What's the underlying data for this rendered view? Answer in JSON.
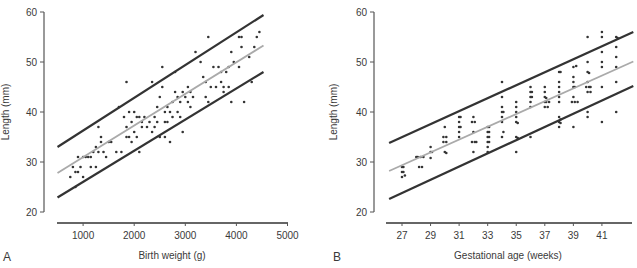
{
  "figure": {
    "panels": [
      "A",
      "B"
    ]
  },
  "chart_data": [
    {
      "panel_label": "A",
      "type": "scatter",
      "title": "",
      "xlabel": "Birth weight (g)",
      "ylabel": "Length (mm)",
      "xlim": [
        500,
        5000
      ],
      "ylim": [
        20,
        60
      ],
      "xticks": [
        1000,
        2000,
        3000,
        4000,
        5000
      ],
      "yticks": [
        20,
        30,
        40,
        50,
        60
      ],
      "grid": false,
      "legend": null,
      "lines": [
        {
          "name": "upper limit",
          "color": "#333333",
          "x": [
            500,
            4530
          ],
          "y": [
            33.0,
            59.4
          ]
        },
        {
          "name": "regression",
          "color": "#aaaaaa",
          "x": [
            500,
            4530
          ],
          "y": [
            27.8,
            53.3
          ]
        },
        {
          "name": "lower limit",
          "color": "#333333",
          "x": [
            500,
            4530
          ],
          "y": [
            22.9,
            48.0
          ]
        }
      ],
      "points": [
        [
          750,
          27
        ],
        [
          800,
          29
        ],
        [
          850,
          28
        ],
        [
          900,
          31
        ],
        [
          900,
          28
        ],
        [
          950,
          29
        ],
        [
          1000,
          31
        ],
        [
          1000,
          27
        ],
        [
          1050,
          31
        ],
        [
          1100,
          31
        ],
        [
          850,
          25
        ],
        [
          1150,
          29
        ],
        [
          1150,
          31
        ],
        [
          1200,
          32
        ],
        [
          1250,
          33
        ],
        [
          1250,
          29
        ],
        [
          1300,
          32
        ],
        [
          1300,
          37
        ],
        [
          1350,
          35
        ],
        [
          1350,
          34
        ],
        [
          1400,
          32
        ],
        [
          1450,
          31
        ],
        [
          1500,
          34
        ],
        [
          1550,
          34
        ],
        [
          1650,
          32
        ],
        [
          1700,
          41
        ],
        [
          1750,
          32
        ],
        [
          1800,
          39
        ],
        [
          1850,
          37
        ],
        [
          1850,
          35
        ],
        [
          1850,
          46
        ],
        [
          1900,
          40
        ],
        [
          1900,
          35
        ],
        [
          1950,
          38
        ],
        [
          1950,
          34
        ],
        [
          2000,
          40
        ],
        [
          2000,
          36
        ],
        [
          2050,
          39
        ],
        [
          2050,
          35
        ],
        [
          2100,
          39
        ],
        [
          2100,
          32
        ],
        [
          2150,
          37
        ],
        [
          2150,
          38
        ],
        [
          2200,
          39
        ],
        [
          2250,
          37
        ],
        [
          2300,
          38
        ],
        [
          2350,
          36
        ],
        [
          2350,
          46
        ],
        [
          2400,
          39
        ],
        [
          2400,
          37
        ],
        [
          2450,
          41
        ],
        [
          2450,
          38
        ],
        [
          2500,
          43
        ],
        [
          2500,
          35
        ],
        [
          2550,
          49
        ],
        [
          2550,
          45
        ],
        [
          2600,
          40
        ],
        [
          2600,
          38
        ],
        [
          2600,
          35
        ],
        [
          2650,
          41
        ],
        [
          2650,
          38
        ],
        [
          2700,
          40
        ],
        [
          2700,
          34
        ],
        [
          2750,
          39
        ],
        [
          2750,
          42
        ],
        [
          2800,
          48
        ],
        [
          2800,
          44
        ],
        [
          2850,
          43
        ],
        [
          2850,
          40
        ],
        [
          2900,
          42
        ],
        [
          2900,
          39
        ],
        [
          2950,
          44
        ],
        [
          2950,
          36
        ],
        [
          3000,
          43
        ],
        [
          3050,
          42
        ],
        [
          3050,
          45
        ],
        [
          3100,
          44
        ],
        [
          3100,
          41
        ],
        [
          3150,
          43
        ],
        [
          3200,
          52
        ],
        [
          3300,
          50
        ],
        [
          3350,
          47
        ],
        [
          3400,
          46
        ],
        [
          3400,
          43
        ],
        [
          3450,
          55
        ],
        [
          3450,
          42
        ],
        [
          3500,
          45
        ],
        [
          3550,
          49
        ],
        [
          3600,
          45
        ],
        [
          3650,
          49
        ],
        [
          3700,
          48
        ],
        [
          3700,
          46
        ],
        [
          3750,
          45
        ],
        [
          3750,
          44
        ],
        [
          3800,
          48
        ],
        [
          3850,
          49
        ],
        [
          3850,
          45
        ],
        [
          3900,
          42
        ],
        [
          3900,
          52
        ],
        [
          3950,
          50
        ],
        [
          4050,
          55
        ],
        [
          4050,
          49
        ],
        [
          4100,
          55
        ],
        [
          4100,
          53
        ],
        [
          4150,
          42
        ],
        [
          4250,
          51
        ],
        [
          4300,
          46
        ],
        [
          4350,
          53
        ],
        [
          4400,
          55
        ],
        [
          4450,
          56
        ]
      ]
    },
    {
      "panel_label": "B",
      "type": "scatter",
      "title": "",
      "xlabel": "Gestational age (weeks)",
      "ylabel": "Length (mm)",
      "xlim": [
        26.1,
        43.2
      ],
      "ylim": [
        20,
        60
      ],
      "xticks": [
        27,
        29,
        31,
        33,
        35,
        37,
        39,
        41
      ],
      "yticks": [
        20,
        30,
        40,
        50,
        60
      ],
      "grid": false,
      "legend": null,
      "lines": [
        {
          "name": "upper limit",
          "color": "#333333",
          "x": [
            26.1,
            43.2
          ],
          "y": [
            33.8,
            56.0
          ]
        },
        {
          "name": "regression",
          "color": "#aaaaaa",
          "x": [
            26.1,
            43.2
          ],
          "y": [
            28.2,
            50.1
          ]
        },
        {
          "name": "lower limit",
          "color": "#333333",
          "x": [
            26.1,
            43.2
          ],
          "y": [
            22.6,
            45.2
          ]
        }
      ],
      "points": [
        [
          27,
          29
        ],
        [
          27.1,
          29
        ],
        [
          27,
          28
        ],
        [
          27.1,
          28
        ],
        [
          27,
          27
        ],
        [
          27.2,
          27.3
        ],
        [
          28,
          31
        ],
        [
          28.1,
          31
        ],
        [
          28.3,
          31
        ],
        [
          28.5,
          31
        ],
        [
          28.2,
          29
        ],
        [
          28.4,
          29
        ],
        [
          29,
          33
        ],
        [
          29,
          32
        ],
        [
          29.1,
          32
        ],
        [
          29,
          30.8
        ],
        [
          30,
          37
        ],
        [
          29.9,
          35
        ],
        [
          30.1,
          35
        ],
        [
          29.9,
          34
        ],
        [
          30.1,
          34
        ],
        [
          30,
          32
        ],
        [
          30.1,
          31.8
        ],
        [
          31,
          39
        ],
        [
          31.1,
          39
        ],
        [
          31,
          38
        ],
        [
          31,
          37
        ],
        [
          31.1,
          37
        ],
        [
          31,
          36
        ],
        [
          31,
          35
        ],
        [
          32,
          39
        ],
        [
          31.9,
          38
        ],
        [
          32.1,
          38
        ],
        [
          32,
          36
        ],
        [
          31.9,
          34
        ],
        [
          32.1,
          34
        ],
        [
          32.2,
          34
        ],
        [
          32,
          32
        ],
        [
          33,
          37
        ],
        [
          33.1,
          37
        ],
        [
          33,
          36
        ],
        [
          33.1,
          36
        ],
        [
          33,
          35
        ],
        [
          33.1,
          35
        ],
        [
          33,
          34
        ],
        [
          33.1,
          34
        ],
        [
          33,
          33
        ],
        [
          33,
          32
        ],
        [
          34,
          46
        ],
        [
          34,
          43
        ],
        [
          34,
          41
        ],
        [
          34,
          40
        ],
        [
          34.1,
          40
        ],
        [
          34,
          39
        ],
        [
          34,
          38
        ],
        [
          34.1,
          36
        ],
        [
          34,
          35
        ],
        [
          35,
          42
        ],
        [
          35,
          41
        ],
        [
          35,
          40
        ],
        [
          35,
          39
        ],
        [
          35,
          38
        ],
        [
          35.1,
          37.8
        ],
        [
          35,
          35
        ],
        [
          35.1,
          34.8
        ],
        [
          35,
          32
        ],
        [
          36,
          45
        ],
        [
          36,
          44
        ],
        [
          36.1,
          44
        ],
        [
          36,
          43
        ],
        [
          36.1,
          43
        ],
        [
          36,
          42
        ],
        [
          36,
          41
        ],
        [
          36,
          35
        ],
        [
          37,
          45
        ],
        [
          37,
          44
        ],
        [
          37,
          43
        ],
        [
          37.1,
          42.8
        ],
        [
          37,
          42
        ],
        [
          37.1,
          42
        ],
        [
          37.3,
          42
        ],
        [
          37,
          41
        ],
        [
          37.2,
          41
        ],
        [
          38,
          48
        ],
        [
          38.1,
          48
        ],
        [
          38,
          46
        ],
        [
          38,
          45
        ],
        [
          38,
          44
        ],
        [
          38,
          43
        ],
        [
          38,
          42
        ],
        [
          38,
          39
        ],
        [
          38.1,
          38.5
        ],
        [
          38,
          38
        ],
        [
          38.1,
          37.8
        ],
        [
          38,
          37
        ],
        [
          39,
          49
        ],
        [
          39.2,
          49.2
        ],
        [
          39,
          47
        ],
        [
          39,
          46
        ],
        [
          39,
          45
        ],
        [
          39.1,
          45
        ],
        [
          39,
          43
        ],
        [
          38.9,
          42
        ],
        [
          39.1,
          42
        ],
        [
          39.3,
          42
        ],
        [
          39,
          37
        ],
        [
          40,
          55
        ],
        [
          40,
          50
        ],
        [
          40,
          48
        ],
        [
          40.1,
          47.8
        ],
        [
          40,
          46
        ],
        [
          39.9,
          45
        ],
        [
          40.1,
          45
        ],
        [
          40.2,
          45
        ],
        [
          40,
          44
        ],
        [
          40.2,
          44
        ],
        [
          40,
          40
        ],
        [
          40,
          39
        ],
        [
          41,
          56
        ],
        [
          41,
          55
        ],
        [
          41,
          52
        ],
        [
          41,
          50
        ],
        [
          41,
          49
        ],
        [
          41,
          45
        ],
        [
          41,
          38
        ],
        [
          42,
          55
        ],
        [
          42.1,
          54.8
        ],
        [
          42,
          53
        ],
        [
          42,
          51
        ],
        [
          42,
          49
        ],
        [
          42,
          46
        ],
        [
          42,
          40
        ]
      ]
    }
  ]
}
